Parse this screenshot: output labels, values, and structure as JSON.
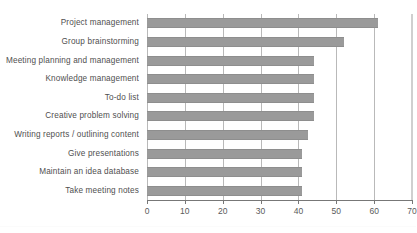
{
  "chart_data": {
    "type": "bar",
    "orientation": "horizontal",
    "title": "",
    "title_visible": false,
    "title_note": "top edge of image clips the chart title; text is unreadable",
    "xlabel": "",
    "ylabel": "",
    "categories": [
      "Project management",
      "Group brainstorming",
      "Meeting planning and management",
      "Knowledge management",
      "To-do list",
      "Creative problem solving",
      "Writing reports / outlining content",
      "Give presentations",
      "Maintain an idea database",
      "Take meeting notes"
    ],
    "values": [
      61,
      52,
      44,
      44,
      44,
      44,
      42.5,
      41,
      41,
      41
    ],
    "xlim": [
      0,
      70
    ],
    "xticks": [
      0,
      10,
      20,
      30,
      40,
      50,
      60,
      70
    ],
    "xtick_labels": [
      "0",
      "10",
      "20",
      "30",
      "40",
      "50",
      "60",
      "70"
    ],
    "grid": "vertical",
    "legend": "none",
    "bar_color": "#9a9a9a",
    "gridline_color": "#b9b9b9",
    "axis_color": "#777777",
    "background": "#ffffff"
  }
}
